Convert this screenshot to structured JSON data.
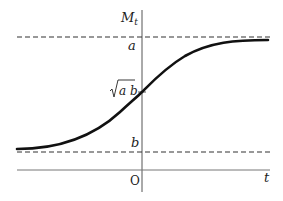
{
  "diagram": {
    "type": "logistic-curve",
    "axes": {
      "y_label": "M",
      "y_label_subscript": "t",
      "x_label": "t",
      "origin_label": "O"
    },
    "levels": {
      "upper_label": "a",
      "middle_label_radicand": "a b",
      "middle_label": "√(ab)",
      "lower_label": "b"
    },
    "style": {
      "curve_color": "#111111",
      "axis_color": "#555555",
      "dashed_color": "#333333",
      "background": "#ffffff"
    }
  }
}
